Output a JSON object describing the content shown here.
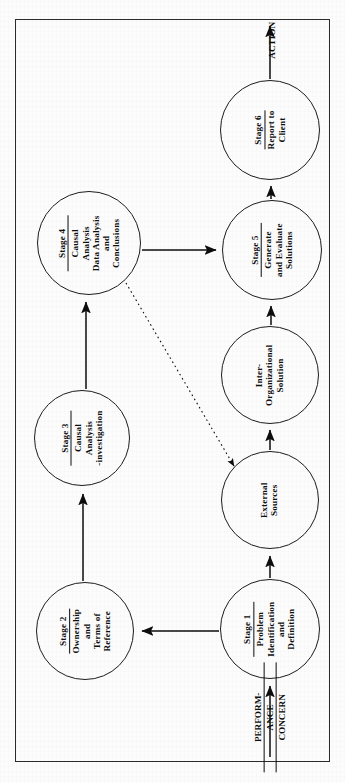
{
  "diagram": {
    "orientation": "rotated-90-ccw",
    "frame_color": "#2b2b2b",
    "ink_color": "#0d0d0d",
    "background_color": "#fbfbfb"
  },
  "nodes": [
    {
      "id": "stage1",
      "stage_label": "Stage 1",
      "lines": [
        "Problem",
        "Identification",
        "and",
        "Definition"
      ],
      "cx": 270,
      "cy": 629,
      "r": 50
    },
    {
      "id": "stage2",
      "stage_label": "Stage 2",
      "lines": [
        "Ownership",
        "and",
        "Terms of",
        "Reference"
      ],
      "cx": 85,
      "cy": 631,
      "r": 49
    },
    {
      "id": "stage3",
      "stage_label": "Stage 3",
      "lines": [
        "Causal",
        "Analysis",
        "-investigation"
      ],
      "cx": 82,
      "cy": 438,
      "r": 48
    },
    {
      "id": "stage4",
      "stage_label": "Stage 4",
      "lines": [
        "Causal",
        "Analysis",
        "Data Analysis",
        "and",
        "Conclusions"
      ],
      "cx": 89,
      "cy": 243,
      "r": 52
    },
    {
      "id": "stage5",
      "stage_label": "Stage 5",
      "lines": [
        "Generate",
        "and Evaluate",
        "Solutions"
      ],
      "cx": 272,
      "cy": 250,
      "r": 50
    },
    {
      "id": "stage6",
      "stage_label": "Stage 6",
      "lines": [
        "Report to",
        "Client"
      ],
      "cx": 270,
      "cy": 130,
      "r": 50
    },
    {
      "id": "external-sources",
      "stage_label": "",
      "lines": [
        "External",
        "Sources"
      ],
      "cx": 270,
      "cy": 500,
      "r": 49
    },
    {
      "id": "inter-organizational-solution",
      "stage_label": "",
      "lines": [
        "Inter-",
        "Organizational",
        "Solution"
      ],
      "cx": 270,
      "cy": 375,
      "r": 49
    }
  ],
  "edges": [
    {
      "id": "performance-concern-to-stage1",
      "from": "performance-concern",
      "to": "stage1",
      "style": "solid"
    },
    {
      "id": "stage1-to-stage2",
      "from": "stage1",
      "to": "stage2",
      "style": "solid"
    },
    {
      "id": "stage2-to-stage3",
      "from": "stage2",
      "to": "stage3",
      "style": "solid"
    },
    {
      "id": "stage3-to-stage4",
      "from": "stage3",
      "to": "stage4",
      "style": "solid"
    },
    {
      "id": "stage4-to-stage5",
      "from": "stage4",
      "to": "stage5",
      "style": "solid"
    },
    {
      "id": "stage4-to-external-sources",
      "from": "stage4",
      "to": "external-sources",
      "style": "dotted"
    },
    {
      "id": "stage1-to-external-sources",
      "from": "stage1",
      "to": "external-sources",
      "style": "solid"
    },
    {
      "id": "external-sources-to-inter-organizational-solution",
      "from": "external-sources",
      "to": "inter-organizational-solution",
      "style": "solid"
    },
    {
      "id": "inter-organizational-solution-to-stage5",
      "from": "inter-organizational-solution",
      "to": "stage5",
      "style": "solid"
    },
    {
      "id": "stage5-to-stage6",
      "from": "stage5",
      "to": "stage6",
      "style": "solid"
    },
    {
      "id": "stage6-to-action",
      "from": "stage6",
      "to": "action",
      "style": "solid"
    }
  ],
  "edge_labels": {
    "performance_concern": {
      "line1": "PERFORM-",
      "line2": "ANCE",
      "line3": "CONCERN"
    },
    "action": "ACTION"
  }
}
